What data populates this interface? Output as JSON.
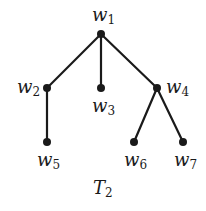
{
  "diagram": {
    "title": "T",
    "title_sub": "2",
    "line_color": "#1a1a1a",
    "nodes": [
      {
        "id": "w1",
        "base": "w",
        "sub": "1"
      },
      {
        "id": "w2",
        "base": "w",
        "sub": "2"
      },
      {
        "id": "w3",
        "base": "w",
        "sub": "3"
      },
      {
        "id": "w4",
        "base": "w",
        "sub": "4"
      },
      {
        "id": "w5",
        "base": "w",
        "sub": "5"
      },
      {
        "id": "w6",
        "base": "w",
        "sub": "6"
      },
      {
        "id": "w7",
        "base": "w",
        "sub": "7"
      }
    ],
    "edges": [
      [
        "w1",
        "w2"
      ],
      [
        "w1",
        "w3"
      ],
      [
        "w1",
        "w4"
      ],
      [
        "w2",
        "w5"
      ],
      [
        "w4",
        "w6"
      ],
      [
        "w4",
        "w7"
      ]
    ]
  }
}
